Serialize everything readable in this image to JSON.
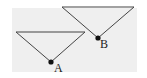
{
  "diagram": {
    "background_color": "#efefef",
    "line_color": "#444444",
    "point_color": "#111111",
    "shapes": [
      {
        "id": "A",
        "label": "A",
        "top_left": [
          16,
          32
        ],
        "top_right": [
          85,
          32
        ],
        "apex": [
          51,
          62
        ],
        "label_pos": [
          54,
          72
        ]
      },
      {
        "id": "B",
        "label": "B",
        "top_left": [
          62,
          7
        ],
        "top_right": [
          134,
          7
        ],
        "apex": [
          98,
          38
        ],
        "label_pos": [
          100,
          48
        ]
      }
    ]
  }
}
